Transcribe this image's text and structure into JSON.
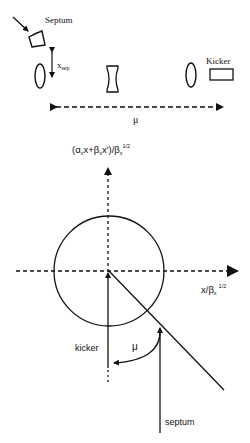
{
  "lattice": {
    "septum_label": "Septum",
    "xsep_label": "x",
    "xsep_sub": "sep",
    "kicker_label": "Kicker",
    "phase_label": "μ"
  },
  "phase_space": {
    "vertical_axis_label": "(α",
    "vertical_axis_parts": {
      "p1": "(α",
      "s1": "x",
      "p2": "x+β",
      "s2": "x",
      "p3": "x')/β",
      "s3": "x",
      "sup": "1/2"
    },
    "horizontal_axis_parts": {
      "p1": "x/β",
      "s1": "x",
      "sup": "1/2"
    },
    "kicker_label": "kicker",
    "septum_label": "septum",
    "phase_label": "μ"
  },
  "colors": {
    "ink": "#111111",
    "background": "#ffffff"
  }
}
